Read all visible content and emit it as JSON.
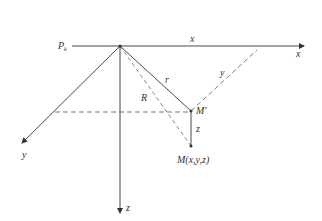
{
  "diagram": {
    "type": "3d-coordinate-geometry",
    "labels": {
      "origin": "P",
      "origin_sub": "k",
      "x_top": "x",
      "x_axis": "x",
      "y_axis": "y",
      "z_axis": "z",
      "r_segment": "r",
      "R_segment": "R",
      "y_segment": "y",
      "z_segment": "z",
      "m_prime": "M'",
      "m_point": "M(x,y,z)"
    },
    "colors": {
      "line": "#333333",
      "dash": "#555555"
    }
  }
}
